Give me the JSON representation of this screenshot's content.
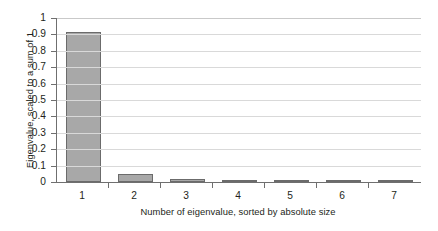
{
  "chart_data": {
    "type": "bar",
    "title": "",
    "subtitle": "",
    "xlabel": "Number of eigenvalue, sorted by absolute size",
    "ylabel": "Eigenvalue, scaled to a sum of 1",
    "categories": [
      "1",
      "2",
      "3",
      "4",
      "5",
      "6",
      "7"
    ],
    "values": [
      0.915,
      0.05,
      0.018,
      0.007,
      0.002,
      0.001,
      0.001
    ],
    "series": [
      {
        "name": "Eigenvalue",
        "values": [
          0.915,
          0.05,
          0.018,
          0.007,
          0.002,
          0.001,
          0.001
        ]
      }
    ],
    "ylim": [
      0,
      1
    ],
    "xlim_categories": 7,
    "ytick_labels": [
      "1",
      "0.9",
      "0.8",
      "0.7",
      "0.6",
      "0.5",
      "0.4",
      "0.3",
      "0.2",
      "0.1",
      "0"
    ],
    "ytick_values": [
      1,
      0.9,
      0.8,
      0.7,
      0.6,
      0.5,
      0.4,
      0.3,
      0.2,
      0.1,
      0
    ],
    "xtick_labels": [
      "1",
      "2",
      "3",
      "4",
      "5",
      "6",
      "7"
    ],
    "grid": true,
    "grid_axis": "y",
    "legend": false,
    "legend_position": "none",
    "bar_fill_color": "#a8a8a8",
    "bar_border_color": "#6b6b6b",
    "gridline_color": "#d9d9d9",
    "axis_color": "#6f6f6f",
    "background_color": "#ffffff",
    "text_color": "#231f20"
  }
}
